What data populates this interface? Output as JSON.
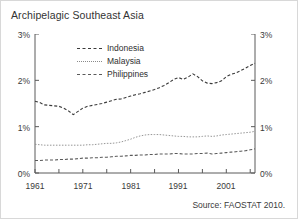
{
  "chart_data": {
    "type": "line",
    "title": "Archipelagic Southeast Asia",
    "xlabel": "",
    "ylabel": "",
    "ylim": [
      0,
      3
    ],
    "xlim": [
      1961,
      2007
    ],
    "grid": false,
    "legend_position": "top-left-inside",
    "y_tick_labels": [
      "0%",
      "1%",
      "2%",
      "3%"
    ],
    "y_tick_values": [
      0,
      1,
      2,
      3
    ],
    "y_axis_right_labels": [
      "0%",
      "1%",
      "2%",
      "3%"
    ],
    "x_tick_labels": [
      "1961",
      "1971",
      "1981",
      "1991",
      "2001"
    ],
    "x_tick_values": [
      1961,
      1971,
      1981,
      1991,
      2001
    ],
    "x_minor_tick_values": [
      1966,
      1976,
      1986,
      1996,
      2006
    ],
    "x": [
      1961,
      1962,
      1963,
      1964,
      1965,
      1966,
      1967,
      1968,
      1969,
      1970,
      1971,
      1972,
      1973,
      1974,
      1975,
      1976,
      1977,
      1978,
      1979,
      1980,
      1981,
      1982,
      1983,
      1984,
      1985,
      1986,
      1987,
      1988,
      1989,
      1990,
      1991,
      1992,
      1993,
      1994,
      1995,
      1996,
      1997,
      1998,
      1999,
      2000,
      2001,
      2002,
      2003,
      2004,
      2005,
      2006,
      2007
    ],
    "series": [
      {
        "name": "Indonesia",
        "color": "#3a3a3a",
        "style": "dashed",
        "values": [
          1.55,
          1.52,
          1.47,
          1.46,
          1.45,
          1.44,
          1.4,
          1.34,
          1.26,
          1.33,
          1.4,
          1.44,
          1.46,
          1.48,
          1.5,
          1.53,
          1.56,
          1.59,
          1.6,
          1.63,
          1.66,
          1.69,
          1.71,
          1.74,
          1.77,
          1.8,
          1.84,
          1.89,
          1.95,
          2.02,
          2.06,
          2.02,
          2.07,
          2.14,
          2.08,
          1.99,
          1.94,
          1.93,
          1.95,
          1.99,
          2.08,
          2.13,
          2.16,
          2.21,
          2.26,
          2.32,
          2.37
        ]
      },
      {
        "name": "Malaysia",
        "color": "#8a8a8a",
        "style": "dotted",
        "values": [
          0.62,
          0.61,
          0.6,
          0.6,
          0.6,
          0.6,
          0.6,
          0.6,
          0.6,
          0.6,
          0.6,
          0.61,
          0.61,
          0.62,
          0.63,
          0.64,
          0.64,
          0.65,
          0.67,
          0.7,
          0.73,
          0.77,
          0.8,
          0.82,
          0.83,
          0.83,
          0.83,
          0.82,
          0.81,
          0.8,
          0.79,
          0.79,
          0.78,
          0.78,
          0.78,
          0.79,
          0.8,
          0.79,
          0.8,
          0.82,
          0.83,
          0.84,
          0.85,
          0.86,
          0.87,
          0.88,
          0.9
        ]
      },
      {
        "name": "Philippines",
        "color": "#5a5a5a",
        "style": "dashed",
        "values": [
          0.27,
          0.27,
          0.28,
          0.28,
          0.28,
          0.29,
          0.29,
          0.3,
          0.3,
          0.31,
          0.32,
          0.32,
          0.33,
          0.33,
          0.34,
          0.34,
          0.35,
          0.36,
          0.36,
          0.37,
          0.38,
          0.38,
          0.39,
          0.39,
          0.4,
          0.4,
          0.41,
          0.41,
          0.41,
          0.42,
          0.42,
          0.41,
          0.41,
          0.41,
          0.42,
          0.42,
          0.43,
          0.41,
          0.42,
          0.43,
          0.44,
          0.45,
          0.46,
          0.47,
          0.48,
          0.5,
          0.52
        ]
      }
    ],
    "source_note": "Source: FAOSTAT 2010."
  },
  "title": "Archipelagic Southeast Asia",
  "source": "Source: FAOSTAT 2010.",
  "legend": {
    "items": [
      {
        "label": "Indonesia"
      },
      {
        "label": "Malaysia"
      },
      {
        "label": "Philippines"
      }
    ]
  },
  "axes": {
    "y_left": [
      "3%",
      "2%",
      "1%",
      "0%"
    ],
    "y_right": [
      "3%",
      "2%",
      "1%",
      "0%"
    ],
    "x": [
      "1961",
      "1971",
      "1981",
      "1991",
      "2001"
    ]
  }
}
